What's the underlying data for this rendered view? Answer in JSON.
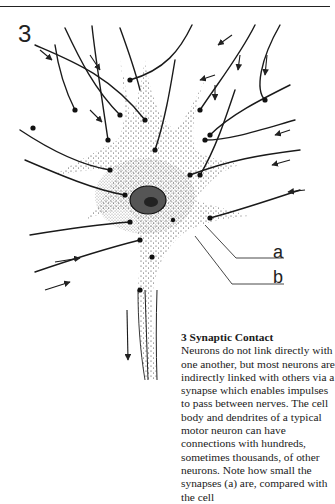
{
  "figure": {
    "number": "3",
    "labels": {
      "a": "a",
      "b": "b"
    }
  },
  "caption": {
    "title": "3  Synaptic Contact",
    "body": "Neurons do not link directly with one another, but most neurons are indirectly linked with others via a synapse which enables impulses to pass between nerves. The cell body and dendrites of a typical motor neuron can have connections with hundreds, sometimes thousands, of other neurons. Note how small the synapses (a) are, compared with the cell"
  }
}
